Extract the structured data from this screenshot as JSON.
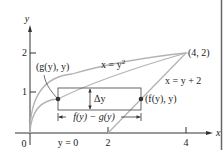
{
  "diagram": {
    "axes": {
      "x_label": "x",
      "y_label": "y",
      "origin_label": "0",
      "x_ticks": [
        "2",
        "4"
      ],
      "y_ticks": [
        "1",
        "2"
      ]
    },
    "curves": [
      {
        "name": "parabola",
        "label": "x = y",
        "superscript": "2",
        "equation": "x = y^2",
        "color": "#b0b0b0"
      },
      {
        "name": "line",
        "label": "x = y + 2",
        "equation": "x = y + 2",
        "color": "#b0b0b0"
      }
    ],
    "points": {
      "intersection": "(4, 2)",
      "left": "(g(y), y)",
      "right": "(f(y), y)"
    },
    "annotations": {
      "delta_y": "Δy",
      "width": "f(y) − g(y)",
      "baseline": "y = 0"
    },
    "colors": {
      "axis": "#333333",
      "curve": "#b0b0b0",
      "rect": "#555555",
      "border": "#555555"
    }
  }
}
